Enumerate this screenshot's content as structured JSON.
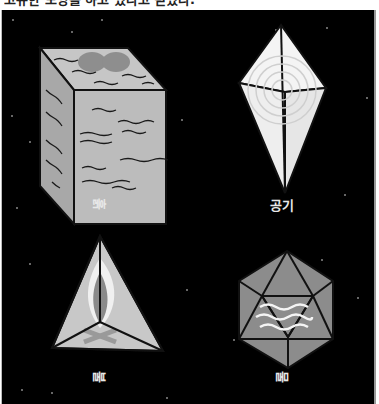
{
  "caption": "고유한 모양을 하고 있다고 믿었다.",
  "colors": {
    "background": "#000000",
    "earth_face": "#b5b5b5",
    "air_face": "#f2f2f2",
    "fire_face": "#c8c8c8",
    "water_face": "#8a8a8a",
    "stroke": "#111111"
  },
  "elements": [
    {
      "id": "earth",
      "label": "흙",
      "shape": "cube",
      "orientation": "rotated-90"
    },
    {
      "id": "air",
      "label": "공기",
      "shape": "octahedron",
      "orientation": "upright"
    },
    {
      "id": "fire",
      "label": "불",
      "shape": "tetrahedron",
      "orientation": "rotated-90"
    },
    {
      "id": "water",
      "label": "물",
      "shape": "icosahedron",
      "orientation": "rotated-90"
    }
  ]
}
